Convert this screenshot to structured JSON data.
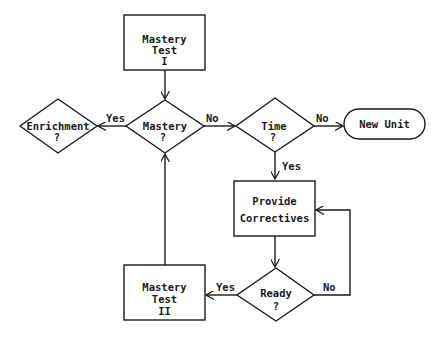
{
  "diagram": {
    "type": "flowchart",
    "nodes": {
      "mastery_test_1": {
        "shape": "rectangle",
        "lines": [
          "Mastery",
          "Test",
          "I"
        ]
      },
      "mastery": {
        "shape": "diamond",
        "lines": [
          "Mastery",
          "?"
        ]
      },
      "enrichment": {
        "shape": "diamond",
        "lines": [
          "Enrichment",
          "?"
        ]
      },
      "time": {
        "shape": "diamond",
        "lines": [
          "Time",
          "?"
        ]
      },
      "new_unit": {
        "shape": "terminal",
        "lines": [
          "New Unit"
        ]
      },
      "provide_correctives": {
        "shape": "rectangle",
        "lines": [
          "Provide",
          "Correctives"
        ]
      },
      "ready": {
        "shape": "diamond",
        "lines": [
          "Ready",
          "?"
        ]
      },
      "mastery_test_2": {
        "shape": "rectangle",
        "lines": [
          "Mastery",
          "Test",
          "II"
        ]
      }
    },
    "edges": {
      "test1_to_mastery": {
        "from": "mastery_test_1",
        "to": "mastery",
        "label": ""
      },
      "mastery_yes": {
        "from": "mastery",
        "to": "enrichment",
        "label": "Yes"
      },
      "mastery_no": {
        "from": "mastery",
        "to": "time",
        "label": "No"
      },
      "time_no": {
        "from": "time",
        "to": "new_unit",
        "label": "No"
      },
      "time_yes": {
        "from": "time",
        "to": "provide_correctives",
        "label": "Yes"
      },
      "correctives_to_ready": {
        "from": "provide_correctives",
        "to": "ready",
        "label": ""
      },
      "ready_no": {
        "from": "ready",
        "to": "provide_correctives",
        "label": "No"
      },
      "ready_yes": {
        "from": "ready",
        "to": "mastery_test_2",
        "label": "Yes"
      },
      "test2_to_mastery": {
        "from": "mastery_test_2",
        "to": "mastery",
        "label": ""
      }
    }
  }
}
